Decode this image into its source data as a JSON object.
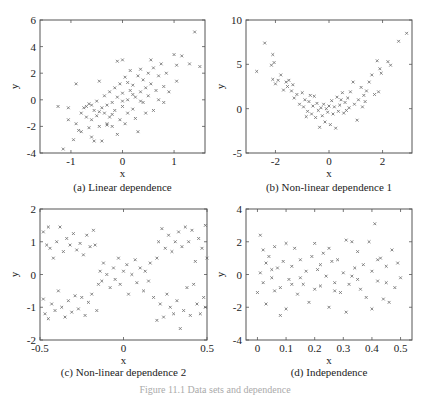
{
  "figure_caption": "Figure 11.1  Data sets and dependence",
  "chart_data": [
    {
      "id": "a",
      "type": "scatter",
      "title": "(a) Linear dependence",
      "xlabel": "x",
      "ylabel": "y",
      "xlim": [
        -1.6,
        1.6
      ],
      "ylim": [
        -4,
        6
      ],
      "xticks": [
        -1,
        0,
        1
      ],
      "yticks": [
        -4,
        -2,
        0,
        2,
        4,
        6
      ],
      "grid": false,
      "marker": "x",
      "marker_color": "#777777",
      "frame": {
        "left": 40,
        "top": 20,
        "right": 205,
        "bottom": 153
      },
      "points": [
        [
          -1.25,
          -0.5
        ],
        [
          -1.15,
          -3.7
        ],
        [
          -1.05,
          -0.6
        ],
        [
          -1.05,
          -1.5
        ],
        [
          -0.9,
          1.2
        ],
        [
          -0.95,
          -3.0
        ],
        [
          -0.9,
          -1.8
        ],
        [
          -0.85,
          -2.3
        ],
        [
          -0.8,
          -1.0
        ],
        [
          -0.8,
          -2.4
        ],
        [
          -0.75,
          -0.6
        ],
        [
          -0.7,
          -0.5
        ],
        [
          -0.7,
          -1.3
        ],
        [
          -0.65,
          -2.1
        ],
        [
          -0.65,
          -0.3
        ],
        [
          -0.6,
          -2.8
        ],
        [
          -0.6,
          -1.5
        ],
        [
          -0.55,
          -0.8
        ],
        [
          -0.55,
          -3.1
        ],
        [
          -0.5,
          -0.1
        ],
        [
          -0.5,
          -1.2
        ],
        [
          -0.45,
          -2.0
        ],
        [
          -0.45,
          1.4
        ],
        [
          -0.4,
          -0.6
        ],
        [
          -0.4,
          -3.1
        ],
        [
          -0.35,
          -1.0
        ],
        [
          -0.35,
          0.3
        ],
        [
          -0.3,
          -1.8
        ],
        [
          -0.3,
          -0.4
        ],
        [
          -0.25,
          0.6
        ],
        [
          -0.25,
          -1.3
        ],
        [
          -0.2,
          -2.0
        ],
        [
          -0.2,
          -0.2
        ],
        [
          -0.15,
          0.9
        ],
        [
          -0.15,
          -0.8
        ],
        [
          -0.1,
          2.9
        ],
        [
          -0.1,
          -2.6
        ],
        [
          -0.1,
          0.2
        ],
        [
          -0.05,
          -1.5
        ],
        [
          -0.05,
          1.2
        ],
        [
          0.0,
          3.0
        ],
        [
          0.0,
          -0.5
        ],
        [
          0.0,
          0.5
        ],
        [
          0.05,
          -1.8
        ],
        [
          0.05,
          1.7
        ],
        [
          0.1,
          0.0
        ],
        [
          0.1,
          -1.0
        ],
        [
          0.15,
          2.2
        ],
        [
          0.15,
          0.7
        ],
        [
          0.2,
          -0.7
        ],
        [
          0.2,
          1.1
        ],
        [
          0.25,
          0.2
        ],
        [
          0.25,
          -1.4
        ],
        [
          0.3,
          1.8
        ],
        [
          0.3,
          -2.4
        ],
        [
          0.35,
          0.6
        ],
        [
          0.35,
          2.3
        ],
        [
          0.4,
          -0.2
        ],
        [
          0.4,
          1.5
        ],
        [
          0.45,
          0.9
        ],
        [
          0.45,
          -1.0
        ],
        [
          0.5,
          2.0
        ],
        [
          0.5,
          0.3
        ],
        [
          0.55,
          3.0
        ],
        [
          0.55,
          1.2
        ],
        [
          0.6,
          -0.8
        ],
        [
          0.6,
          2.4
        ],
        [
          0.65,
          0.7
        ],
        [
          0.7,
          1.8
        ],
        [
          0.7,
          0.0
        ],
        [
          0.75,
          2.7
        ],
        [
          0.8,
          1.0
        ],
        [
          0.8,
          -0.2
        ],
        [
          0.85,
          2.0
        ],
        [
          0.9,
          0.6
        ],
        [
          1.0,
          3.4
        ],
        [
          1.05,
          2.6
        ],
        [
          1.05,
          1.4
        ],
        [
          1.15,
          3.3
        ],
        [
          1.3,
          2.7
        ],
        [
          1.4,
          5.1
        ],
        [
          1.5,
          2.5
        ],
        [
          -0.3,
          -1.9
        ],
        [
          -0.2,
          -1.1
        ],
        [
          0.0,
          -0.1
        ],
        [
          0.2,
          0.4
        ],
        [
          -0.45,
          -0.9
        ],
        [
          0.1,
          1.3
        ],
        [
          0.35,
          -0.1
        ],
        [
          -0.6,
          -0.4
        ]
      ]
    },
    {
      "id": "b",
      "type": "scatter",
      "title": "(b) Non-linear dependence 1",
      "xlabel": "x",
      "ylabel": "y",
      "xlim": [
        -3.1,
        3.1
      ],
      "ylim": [
        -5,
        10
      ],
      "xticks": [
        -2,
        0,
        2
      ],
      "yticks": [
        -5,
        0,
        5,
        10
      ],
      "grid": false,
      "marker": "x",
      "marker_color": "#777777",
      "frame": {
        "left": 246,
        "top": 20,
        "right": 412,
        "bottom": 153
      },
      "points": [
        [
          -2.7,
          4.2
        ],
        [
          -2.4,
          7.4
        ],
        [
          -2.1,
          6.1
        ],
        [
          -2.15,
          4.9
        ],
        [
          -2.05,
          5.2
        ],
        [
          -2.1,
          3.3
        ],
        [
          -2.0,
          2.8
        ],
        [
          -1.8,
          3.8
        ],
        [
          -1.7,
          2.1
        ],
        [
          -1.6,
          3.0
        ],
        [
          -1.5,
          3.2
        ],
        [
          -1.4,
          2.0
        ],
        [
          -1.35,
          2.7
        ],
        [
          -1.3,
          1.2
        ],
        [
          -1.2,
          1.6
        ],
        [
          -1.1,
          0.5
        ],
        [
          -1.0,
          1.8
        ],
        [
          -0.95,
          0.2
        ],
        [
          -0.9,
          1.0
        ],
        [
          -0.8,
          -0.3
        ],
        [
          -0.75,
          0.8
        ],
        [
          -0.7,
          1.5
        ],
        [
          -0.65,
          -0.6
        ],
        [
          -0.6,
          0.3
        ],
        [
          -0.5,
          -1.0
        ],
        [
          -0.45,
          0.6
        ],
        [
          -0.4,
          -0.2
        ],
        [
          -0.35,
          -2.1
        ],
        [
          -0.3,
          0.1
        ],
        [
          -0.25,
          -0.8
        ],
        [
          -0.2,
          0.5
        ],
        [
          -0.15,
          -1.5
        ],
        [
          -0.1,
          0.0
        ],
        [
          -0.05,
          -0.4
        ],
        [
          0.0,
          0.3
        ],
        [
          0.05,
          -1.8
        ],
        [
          0.1,
          0.9
        ],
        [
          0.15,
          -0.6
        ],
        [
          0.2,
          0.2
        ],
        [
          0.25,
          -2.2
        ],
        [
          0.3,
          1.3
        ],
        [
          0.35,
          -0.3
        ],
        [
          0.4,
          0.4
        ],
        [
          0.5,
          1.8
        ],
        [
          0.55,
          -0.5
        ],
        [
          0.6,
          0.7
        ],
        [
          0.7,
          1.2
        ],
        [
          0.75,
          0.1
        ],
        [
          0.8,
          1.9
        ],
        [
          0.9,
          3.0
        ],
        [
          0.95,
          0.5
        ],
        [
          1.05,
          -1.3
        ],
        [
          1.1,
          1.0
        ],
        [
          1.2,
          2.4
        ],
        [
          1.25,
          0.2
        ],
        [
          1.3,
          1.5
        ],
        [
          1.4,
          2.0
        ],
        [
          1.5,
          3.0
        ],
        [
          1.6,
          3.8
        ],
        [
          1.7,
          1.6
        ],
        [
          1.8,
          5.4
        ],
        [
          1.85,
          1.9
        ],
        [
          1.9,
          4.5
        ],
        [
          1.95,
          4.0
        ],
        [
          2.2,
          5.3
        ],
        [
          2.3,
          4.9
        ],
        [
          2.6,
          7.6
        ],
        [
          2.9,
          8.5
        ],
        [
          -1.9,
          3.2
        ],
        [
          -1.55,
          2.5
        ],
        [
          -0.85,
          -0.9
        ],
        [
          0.65,
          -0.2
        ],
        [
          1.35,
          0.8
        ],
        [
          -0.55,
          1.4
        ],
        [
          0.45,
          1.0
        ]
      ]
    },
    {
      "id": "c",
      "type": "scatter",
      "title": "(c) Non-linear dependence 2",
      "xlabel": "x",
      "ylabel": "y",
      "xlim": [
        -0.5,
        0.5
      ],
      "ylim": [
        -2,
        2
      ],
      "xticks": [
        -0.5,
        0,
        0.5
      ],
      "yticks": [
        -2,
        -1,
        0,
        1,
        2
      ],
      "grid": false,
      "marker": "x",
      "marker_color": "#777777",
      "frame": {
        "left": 40,
        "top": 209,
        "right": 207,
        "bottom": 340
      },
      "points": [
        [
          -0.48,
          1.3
        ],
        [
          -0.46,
          0.9
        ],
        [
          -0.45,
          1.45
        ],
        [
          -0.44,
          0.8
        ],
        [
          -0.42,
          0.5
        ],
        [
          -0.4,
          1.0
        ],
        [
          -0.38,
          1.45
        ],
        [
          -0.36,
          0.7
        ],
        [
          -0.34,
          1.1
        ],
        [
          -0.32,
          0.9
        ],
        [
          -0.3,
          1.25
        ],
        [
          -0.28,
          0.75
        ],
        [
          -0.26,
          0.95
        ],
        [
          -0.24,
          0.6
        ],
        [
          -0.22,
          1.2
        ],
        [
          -0.2,
          0.85
        ],
        [
          -0.18,
          1.35
        ],
        [
          -0.17,
          0.9
        ],
        [
          -0.48,
          -0.75
        ],
        [
          -0.47,
          -1.2
        ],
        [
          -0.45,
          -1.35
        ],
        [
          -0.43,
          -0.9
        ],
        [
          -0.41,
          -1.1
        ],
        [
          -0.39,
          -0.5
        ],
        [
          -0.37,
          -1.0
        ],
        [
          -0.35,
          -1.3
        ],
        [
          -0.33,
          -0.8
        ],
        [
          -0.31,
          -1.15
        ],
        [
          -0.29,
          -0.65
        ],
        [
          -0.27,
          -1.05
        ],
        [
          -0.25,
          -0.7
        ],
        [
          -0.23,
          -1.25
        ],
        [
          -0.21,
          -0.85
        ],
        [
          -0.19,
          -0.6
        ],
        [
          -0.16,
          -1.1
        ],
        [
          -0.15,
          -0.3
        ],
        [
          -0.14,
          0.1
        ],
        [
          -0.13,
          -0.2
        ],
        [
          -0.12,
          0.35
        ],
        [
          -0.1,
          0.0
        ],
        [
          -0.08,
          -0.4
        ],
        [
          -0.06,
          0.2
        ],
        [
          -0.05,
          -0.15
        ],
        [
          -0.03,
          0.5
        ],
        [
          -0.02,
          -0.3
        ],
        [
          0.0,
          0.1
        ],
        [
          0.02,
          0.3
        ],
        [
          0.03,
          -0.6
        ],
        [
          0.05,
          0.0
        ],
        [
          0.07,
          0.45
        ],
        [
          0.08,
          -0.25
        ],
        [
          0.1,
          0.2
        ],
        [
          0.12,
          -0.5
        ],
        [
          0.13,
          0.1
        ],
        [
          0.15,
          -0.2
        ],
        [
          0.16,
          0.35
        ],
        [
          0.18,
          -0.7
        ],
        [
          0.2,
          0.5
        ],
        [
          0.21,
          1.0
        ],
        [
          0.23,
          1.4
        ],
        [
          0.25,
          0.8
        ],
        [
          0.27,
          1.2
        ],
        [
          0.29,
          0.7
        ],
        [
          0.31,
          1.0
        ],
        [
          0.33,
          1.3
        ],
        [
          0.35,
          0.85
        ],
        [
          0.37,
          1.45
        ],
        [
          0.39,
          1.0
        ],
        [
          0.41,
          1.35
        ],
        [
          0.43,
          0.4
        ],
        [
          0.45,
          1.1
        ],
        [
          0.47,
          0.8
        ],
        [
          0.49,
          1.5
        ],
        [
          0.5,
          0.5
        ],
        [
          0.2,
          -1.4
        ],
        [
          0.22,
          -0.9
        ],
        [
          0.24,
          -1.3
        ],
        [
          0.26,
          -0.6
        ],
        [
          0.28,
          -1.0
        ],
        [
          0.3,
          -1.2
        ],
        [
          0.32,
          -0.8
        ],
        [
          0.34,
          -1.65
        ],
        [
          0.36,
          -1.1
        ],
        [
          0.38,
          -0.4
        ],
        [
          0.4,
          -1.25
        ],
        [
          0.42,
          -0.3
        ],
        [
          0.44,
          -0.9
        ],
        [
          0.46,
          -1.2
        ],
        [
          0.48,
          -0.7
        ],
        [
          0.49,
          -1.0
        ]
      ]
    },
    {
      "id": "d",
      "type": "scatter",
      "title": "(d) Independence",
      "xlabel": "x",
      "ylabel": "y",
      "xlim": [
        -0.04,
        0.54
      ],
      "ylim": [
        -4,
        4
      ],
      "xticks": [
        0,
        0.1,
        0.2,
        0.3,
        0.4,
        0.5
      ],
      "yticks": [
        -4,
        -2,
        0,
        2,
        4
      ],
      "grid": false,
      "marker": "x",
      "marker_color": "#777777",
      "frame": {
        "left": 246,
        "top": 209,
        "right": 412,
        "bottom": 340
      },
      "points": [
        [
          0.0,
          -1.1
        ],
        [
          0.01,
          2.4
        ],
        [
          0.01,
          0.1
        ],
        [
          0.02,
          1.5
        ],
        [
          0.02,
          -0.5
        ],
        [
          0.03,
          -1.8
        ],
        [
          0.03,
          0.7
        ],
        [
          0.04,
          1.1
        ],
        [
          0.05,
          -0.2
        ],
        [
          0.06,
          1.7
        ],
        [
          0.06,
          -1.0
        ],
        [
          0.07,
          0.4
        ],
        [
          0.08,
          -2.5
        ],
        [
          0.08,
          -0.8
        ],
        [
          0.09,
          0.8
        ],
        [
          0.1,
          -2.1
        ],
        [
          0.1,
          1.9
        ],
        [
          0.11,
          -0.3
        ],
        [
          0.12,
          0.5
        ],
        [
          0.13,
          1.6
        ],
        [
          0.14,
          -1.2
        ],
        [
          0.15,
          0.9
        ],
        [
          0.16,
          -0.6
        ],
        [
          0.17,
          0.2
        ],
        [
          0.18,
          -1.7
        ],
        [
          0.19,
          1.1
        ],
        [
          0.2,
          -0.9
        ],
        [
          0.2,
          1.9
        ],
        [
          0.21,
          0.3
        ],
        [
          0.22,
          -0.7
        ],
        [
          0.23,
          1.3
        ],
        [
          0.24,
          -0.1
        ],
        [
          0.25,
          1.6
        ],
        [
          0.25,
          -2.0
        ],
        [
          0.26,
          0.8
        ],
        [
          0.27,
          -0.5
        ],
        [
          0.28,
          0.9
        ],
        [
          0.29,
          -1.1
        ],
        [
          0.3,
          0.1
        ],
        [
          0.31,
          2.1
        ],
        [
          0.31,
          -2.3
        ],
        [
          0.32,
          -0.6
        ],
        [
          0.33,
          2.0
        ],
        [
          0.34,
          0.4
        ],
        [
          0.35,
          1.4
        ],
        [
          0.36,
          -0.9
        ],
        [
          0.37,
          0.6
        ],
        [
          0.38,
          -1.4
        ],
        [
          0.39,
          2.0
        ],
        [
          0.4,
          -2.1
        ],
        [
          0.4,
          0.2
        ],
        [
          0.41,
          3.1
        ],
        [
          0.42,
          -0.4
        ],
        [
          0.43,
          1.0
        ],
        [
          0.44,
          -1.5
        ],
        [
          0.45,
          0.5
        ],
        [
          0.46,
          -1.7
        ],
        [
          0.47,
          1.5
        ],
        [
          0.48,
          -0.8
        ],
        [
          0.49,
          0.7
        ],
        [
          0.5,
          -0.2
        ],
        [
          0.05,
          0.3
        ],
        [
          0.15,
          -0.2
        ],
        [
          0.27,
          -1.0
        ],
        [
          0.35,
          -0.3
        ],
        [
          0.45,
          -0.5
        ],
        [
          0.12,
          -0.6
        ],
        [
          0.22,
          0.6
        ],
        [
          0.33,
          -0.1
        ],
        [
          0.42,
          0.9
        ]
      ]
    }
  ]
}
